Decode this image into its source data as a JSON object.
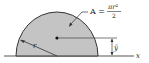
{
  "diagram": {
    "shape": "semicircle",
    "fill_color": "#c4c4c4",
    "stroke_color": "#333333",
    "area_label": {
      "lhs": "A =",
      "numerator": "πr²",
      "denominator": "2"
    },
    "radius_label": "r",
    "centroid_label": "ȳ",
    "axis_label": "x"
  }
}
